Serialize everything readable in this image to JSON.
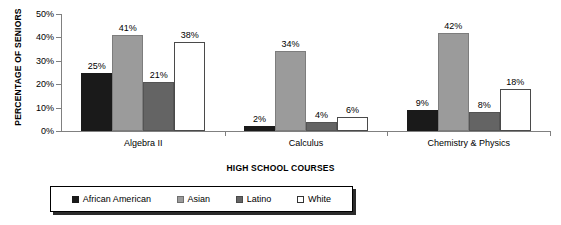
{
  "chart_data": {
    "type": "bar",
    "title": "",
    "xlabel": "HIGH SCHOOL COURSES",
    "ylabel": "PERCENTAGE OF SENIORS",
    "categories": [
      "Algebra II",
      "Calculus",
      "Chemistry & Physics"
    ],
    "series": [
      {
        "name": "African American",
        "values": [
          25,
          2,
          9
        ],
        "color": "#1a1a1a"
      },
      {
        "name": "Asian",
        "values": [
          41,
          34,
          42
        ],
        "color": "#9b9b9b"
      },
      {
        "name": "Latino",
        "values": [
          21,
          4,
          8
        ],
        "color": "#646464"
      },
      {
        "name": "White",
        "values": [
          38,
          6,
          18
        ],
        "color": "#ffffff"
      }
    ],
    "value_labels": [
      [
        "25%",
        "41%",
        "21%",
        "38%"
      ],
      [
        "2%",
        "34%",
        "4%",
        "6%"
      ],
      [
        "9%",
        "42%",
        "8%",
        "18%"
      ]
    ],
    "ylim": [
      0,
      50
    ],
    "yticks": [
      0,
      10,
      20,
      30,
      40,
      50
    ],
    "ytick_labels": [
      "0%",
      "10%",
      "20%",
      "30%",
      "40%",
      "50%"
    ],
    "grid": false,
    "legend_position": "bottom"
  }
}
